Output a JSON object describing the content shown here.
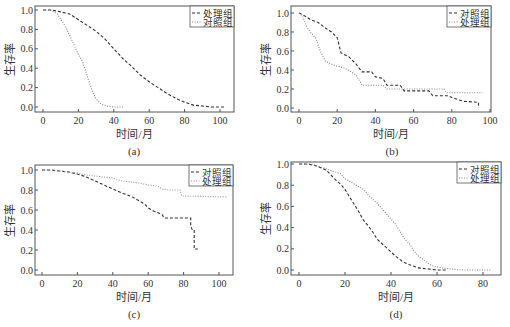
{
  "figure": {
    "panel_labels": [
      "(a)",
      "(b)",
      "(c)",
      "(d)"
    ]
  },
  "chart_data": [
    {
      "type": "line",
      "panel": "(a)",
      "title": "",
      "xlabel": "时间/月",
      "ylabel": "生存率",
      "xlim": [
        -3,
        107
      ],
      "ylim": [
        -0.04,
        1.04
      ],
      "xticks": [
        0,
        20,
        40,
        60,
        80,
        100
      ],
      "yticks": [
        0.0,
        0.2,
        0.4,
        0.6,
        0.8,
        1.0
      ],
      "ytick_labels": [
        "0.0",
        "0.2",
        "0.4",
        "0.6",
        "0.8",
        "1.0"
      ],
      "grid": false,
      "legend_position": "upper right",
      "frame": {
        "left": 35,
        "right": 234,
        "top": 6,
        "bottom": 112
      },
      "x0px": 43,
      "x100px": 220,
      "y0px": 107,
      "y1px": 10,
      "series": [
        {
          "name": "处理组",
          "style": "dashed",
          "color": "#333333",
          "x": [
            0,
            5,
            10,
            15,
            20,
            25,
            30,
            35,
            40,
            45,
            50,
            55,
            60,
            65,
            70,
            75,
            80,
            85,
            90,
            95,
            100,
            103
          ],
          "y": [
            1.0,
            1.0,
            0.98,
            0.96,
            0.9,
            0.84,
            0.78,
            0.7,
            0.6,
            0.5,
            0.42,
            0.33,
            0.26,
            0.2,
            0.14,
            0.09,
            0.05,
            0.02,
            0.01,
            0.0,
            0.0,
            0.0
          ]
        },
        {
          "name": "对照组",
          "style": "dotted",
          "color": "#888888",
          "x": [
            0,
            4,
            8,
            12,
            15,
            18,
            20,
            22,
            24,
            26,
            28,
            30,
            33,
            36,
            40,
            44,
            46
          ],
          "y": [
            1.0,
            1.0,
            0.96,
            0.85,
            0.74,
            0.62,
            0.54,
            0.48,
            0.38,
            0.26,
            0.16,
            0.08,
            0.03,
            0.01,
            0.0,
            0.0,
            0.0
          ]
        }
      ]
    },
    {
      "type": "line",
      "panel": "(b)",
      "title": "",
      "xlabel": "时间/月",
      "ylabel": "生存率",
      "xlim": [
        -3,
        103
      ],
      "ylim": [
        -0.03,
        1.03
      ],
      "xticks": [
        0,
        20,
        40,
        60,
        80,
        100
      ],
      "yticks": [
        0.0,
        0.2,
        0.4,
        0.6,
        0.8,
        1.0
      ],
      "ytick_labels": [
        "0.0",
        "0.2",
        "0.4",
        "0.6",
        "0.8",
        "1.0"
      ],
      "grid": false,
      "legend_position": "upper right",
      "frame": {
        "left": 291,
        "right": 491,
        "top": 6,
        "bottom": 112
      },
      "x0px": 299,
      "x100px": 490,
      "y0px": 108,
      "y1px": 13,
      "series": [
        {
          "name": "对照组",
          "style": "dashed",
          "color": "#333333",
          "x": [
            0,
            3,
            6,
            10,
            14,
            17,
            20,
            22,
            26,
            30,
            33,
            38,
            40,
            44,
            46,
            53,
            55,
            68,
            70,
            78,
            80,
            86,
            94,
            94
          ],
          "y": [
            1.0,
            0.97,
            0.93,
            0.9,
            0.84,
            0.8,
            0.74,
            0.58,
            0.54,
            0.46,
            0.38,
            0.38,
            0.33,
            0.31,
            0.24,
            0.24,
            0.18,
            0.18,
            0.13,
            0.13,
            0.11,
            0.07,
            0.06,
            0.0
          ]
        },
        {
          "name": "处理组",
          "style": "dotted",
          "color": "#888888",
          "x": [
            0,
            2,
            4,
            6,
            9,
            10,
            12,
            14,
            17,
            20,
            24,
            28,
            30,
            32,
            33,
            44,
            46,
            53,
            55,
            76,
            77,
            96
          ],
          "y": [
            1.0,
            0.96,
            0.86,
            0.8,
            0.73,
            0.66,
            0.56,
            0.49,
            0.46,
            0.44,
            0.42,
            0.37,
            0.34,
            0.28,
            0.24,
            0.24,
            0.2,
            0.2,
            0.2,
            0.2,
            0.16,
            0.16
          ]
        }
      ]
    },
    {
      "type": "line",
      "panel": "(c)",
      "title": "",
      "xlabel": "时间/月",
      "ylabel": "生存率",
      "xlim": [
        -3,
        108
      ],
      "ylim": [
        -0.04,
        1.04
      ],
      "xticks": [
        0,
        20,
        40,
        60,
        80,
        100
      ],
      "yticks": [
        0.0,
        0.2,
        0.4,
        0.6,
        0.8,
        1.0
      ],
      "ytick_labels": [
        "0.0",
        "0.2",
        "0.4",
        "0.6",
        "0.8",
        "1.0"
      ],
      "grid": false,
      "legend_position": "upper right",
      "frame": {
        "left": 35,
        "right": 233,
        "top": 165,
        "bottom": 275
      },
      "x0px": 42,
      "x100px": 219,
      "y0px": 270,
      "y1px": 170,
      "series": [
        {
          "name": "对照组",
          "style": "dashed",
          "color": "#333333",
          "x": [
            0,
            5,
            10,
            15,
            20,
            25,
            30,
            35,
            40,
            45,
            50,
            55,
            58,
            60,
            63,
            66,
            68,
            69,
            84,
            84,
            85,
            86,
            86,
            88
          ],
          "y": [
            1.0,
            1.0,
            0.99,
            0.98,
            0.96,
            0.93,
            0.89,
            0.85,
            0.81,
            0.77,
            0.74,
            0.69,
            0.66,
            0.62,
            0.59,
            0.57,
            0.55,
            0.52,
            0.52,
            0.44,
            0.4,
            0.4,
            0.21,
            0.21
          ]
        },
        {
          "name": "处理组",
          "style": "dotted",
          "color": "#999999",
          "x": [
            0,
            10,
            15,
            20,
            25,
            30,
            35,
            40,
            45,
            50,
            55,
            60,
            65,
            68,
            72,
            78,
            79,
            105
          ],
          "y": [
            1.0,
            0.99,
            0.98,
            0.97,
            0.95,
            0.94,
            0.93,
            0.92,
            0.89,
            0.88,
            0.87,
            0.85,
            0.84,
            0.81,
            0.8,
            0.8,
            0.74,
            0.73
          ]
        }
      ]
    },
    {
      "type": "line",
      "panel": "(d)",
      "title": "",
      "xlabel": "时间/月",
      "ylabel": "生存率",
      "xlim": [
        -3,
        88
      ],
      "ylim": [
        -0.04,
        1.04
      ],
      "xticks": [
        0,
        20,
        40,
        60,
        80
      ],
      "yticks": [
        0.0,
        0.2,
        0.4,
        0.6,
        0.8,
        1.0
      ],
      "ytick_labels": [
        "0.0",
        "0.2",
        "0.4",
        "0.6",
        "0.8",
        "1.0"
      ],
      "grid": false,
      "legend_position": "upper right",
      "frame": {
        "left": 291,
        "right": 501,
        "top": 162,
        "bottom": 275
      },
      "x0px": 299,
      "x100px": 529,
      "y0px": 270,
      "y1px": 164,
      "series": [
        {
          "name": "对照组",
          "style": "dashed",
          "color": "#333333",
          "x": [
            0,
            4,
            8,
            12,
            15,
            18,
            20,
            22,
            24,
            26,
            28,
            30,
            32,
            34,
            36,
            38,
            40,
            42,
            45,
            48,
            52,
            56,
            60,
            64
          ],
          "y": [
            1.0,
            1.0,
            0.98,
            0.94,
            0.87,
            0.81,
            0.76,
            0.69,
            0.62,
            0.55,
            0.47,
            0.42,
            0.36,
            0.29,
            0.25,
            0.21,
            0.17,
            0.13,
            0.08,
            0.05,
            0.02,
            0.01,
            0.0,
            0.0
          ]
        },
        {
          "name": "处理组",
          "style": "dotted",
          "color": "#888888",
          "x": [
            0,
            5,
            10,
            15,
            18,
            20,
            24,
            28,
            30,
            32,
            34,
            36,
            38,
            40,
            42,
            44,
            46,
            48,
            50,
            52,
            55,
            58,
            62,
            66,
            70,
            75,
            84
          ],
          "y": [
            1.0,
            1.0,
            0.97,
            0.93,
            0.91,
            0.86,
            0.81,
            0.76,
            0.71,
            0.67,
            0.63,
            0.58,
            0.53,
            0.48,
            0.43,
            0.36,
            0.29,
            0.25,
            0.18,
            0.13,
            0.08,
            0.04,
            0.02,
            0.01,
            0.0,
            0.0,
            0.0
          ]
        }
      ]
    }
  ]
}
